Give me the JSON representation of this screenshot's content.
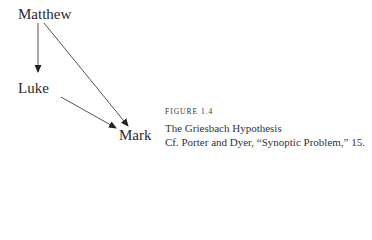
{
  "diagram": {
    "nodes": [
      {
        "id": "matthew",
        "label": "Matthew"
      },
      {
        "id": "luke",
        "label": "Luke"
      },
      {
        "id": "mark",
        "label": "Mark"
      }
    ],
    "edges": [
      {
        "from": "Matthew",
        "to": "Luke"
      },
      {
        "from": "Matthew",
        "to": "Mark"
      },
      {
        "from": "Luke",
        "to": "Mark"
      }
    ]
  },
  "caption": {
    "label": "FIGURE 1.4",
    "title": "The Griesbach Hypothesis",
    "source": "Cf. Porter and Dyer, “Synoptic Problem,” 15."
  },
  "colors": {
    "text": "#2a2a2a",
    "edge": "#333333"
  }
}
